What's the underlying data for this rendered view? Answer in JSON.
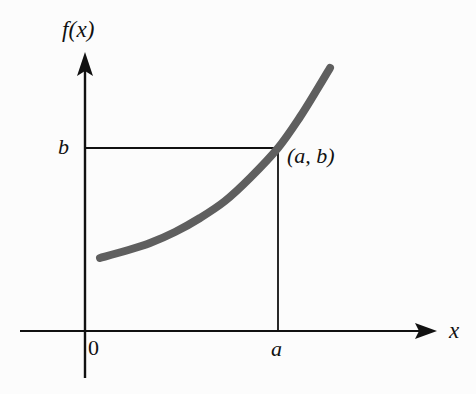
{
  "figure": {
    "name": "increasing-function-graph",
    "background_color": "#fcfcfc",
    "axis_color": "#111111",
    "curve_color": "#5f5f5f",
    "width": 476,
    "height": 394
  },
  "labels": {
    "y_axis": "f(x)",
    "x_axis": "x",
    "origin": "0",
    "y_value": "b",
    "x_value": "a",
    "point": "(a, b)"
  },
  "icons": {
    "y_axis_arrow": "arrow-up-icon",
    "x_axis_arrow": "arrow-right-icon"
  },
  "chart_data": {
    "type": "line",
    "title": "",
    "subtitle": "",
    "xlabel": "x",
    "ylabel": "f(x)",
    "grid": false,
    "legend": null,
    "axis_style": {
      "x_axis_y_px": 331,
      "y_axis_x_px": 85,
      "x_axis_from_px": 20,
      "x_axis_to_px": 437,
      "y_axis_from_px": 378,
      "y_axis_to_px": 52,
      "arrowheads": [
        "x-right",
        "y-up"
      ]
    },
    "tick_labels": {
      "x": [
        "0",
        "a"
      ],
      "y": [
        "b"
      ]
    },
    "annotations": [
      {
        "text": "(a, b)",
        "x_px": 287,
        "y_px": 145,
        "describes": "point where curve crosses height b at abscissa a"
      }
    ],
    "guide_lines": [
      {
        "name": "horizontal-guide-b",
        "from_px": [
          85,
          148
        ],
        "to_px": [
          278,
          148
        ],
        "style": "solid"
      },
      {
        "name": "vertical-guide-a",
        "from_px": [
          278,
          148
        ],
        "to_px": [
          278,
          331
        ],
        "style": "solid"
      }
    ],
    "series": [
      {
        "name": "f(x)",
        "color": "#5f5f5f",
        "stroke_width_px": 8,
        "points_px": [
          [
            100,
            258
          ],
          [
            125,
            251
          ],
          [
            150,
            243
          ],
          [
            175,
            232
          ],
          [
            200,
            218
          ],
          [
            225,
            201
          ],
          [
            250,
            178
          ],
          [
            278,
            148
          ],
          [
            300,
            117
          ],
          [
            318,
            88
          ],
          [
            330,
            68
          ]
        ]
      }
    ]
  }
}
